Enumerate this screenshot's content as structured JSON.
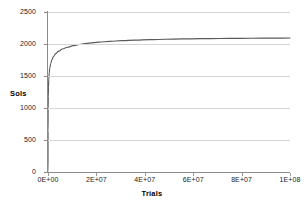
{
  "chart_data": {
    "type": "line",
    "title": "",
    "xlabel": "Trials",
    "ylabel": "Sols",
    "xlim": [
      0,
      100000000
    ],
    "ylim": [
      0,
      2500
    ],
    "grid": true,
    "legend": false,
    "legend_position": "none",
    "series_color": "#5a5a5a",
    "gridline_color": "#d6d6d6",
    "axis_color": "#8a8a8a",
    "text_color": "#1a1a1a",
    "x_ticks": [
      0,
      20000000,
      40000000,
      60000000,
      80000000,
      100000000
    ],
    "x_tick_labels": [
      "0E+00",
      "2E+07",
      "4E+07",
      "6E+07",
      "8E+07",
      "1E+08"
    ],
    "y_ticks": [
      0,
      500,
      1000,
      1500,
      2000,
      2500
    ],
    "y_tick_labels": [
      "0",
      "500",
      "1000",
      "1500",
      "2000",
      "2500"
    ],
    "series": [
      {
        "name": "Sols",
        "x": [
          0,
          20000,
          60000,
          120000,
          200000,
          320000,
          500000,
          750000,
          1100000,
          1600000,
          2300000,
          3200000,
          4400000,
          6000000,
          8000000,
          10500000,
          13500000,
          17000000,
          21000000,
          25500000,
          30500000,
          36000000,
          42000000,
          48500000,
          55500000,
          63000000,
          71000000,
          79500000,
          88500000,
          94000000,
          100000000
        ],
        "y": [
          0,
          640,
          980,
          1180,
          1330,
          1450,
          1545,
          1625,
          1692,
          1752,
          1805,
          1850,
          1888,
          1922,
          1950,
          1975,
          1996,
          2014,
          2029,
          2042,
          2052,
          2061,
          2068,
          2074,
          2079,
          2083,
          2086,
          2089,
          2091,
          2092,
          2093
        ]
      }
    ]
  },
  "axes": {
    "y_title": "Sols",
    "x_title": "Trials"
  }
}
